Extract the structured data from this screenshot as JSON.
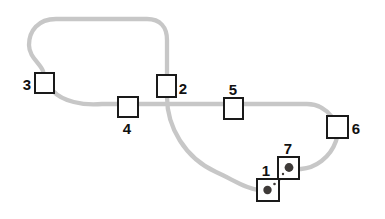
{
  "figure": {
    "width": 385,
    "height": 219,
    "background": "#ffffff",
    "track": {
      "name": "route-track",
      "d": "M 56 19 L 147 19 C 160 19 167 27 167 40 L 167 97 C 167 127 185 158 216 172 C 234 180 246 189 259 190 L 269 190 L 288 169 L 301 169 C 315 168 330 158 336 141 C 339 132 338 124 332 117 C 327 110 318 104 307 104 L 102 104 C 83 106 62 101 53 91 C 47 84 44 78 43 71 C 40 63 29 57 29 45 C 29 31 38 19 56 19 Z",
      "color": "#c7c7c7",
      "stroke_width": 4.3
    },
    "box_style": {
      "fill": "#ffffff",
      "border_color": "#1a1a1a",
      "border_width": 2
    },
    "label_color": "#111111",
    "dot_color": "#3e3a38",
    "boxes": [
      {
        "id": "3",
        "label": "3",
        "x": 35,
        "y": 73,
        "w": 19,
        "h": 20,
        "label_x": 27,
        "label_y": 90,
        "dot": null,
        "speck": null
      },
      {
        "id": "2",
        "label": "2",
        "x": 157,
        "y": 75,
        "w": 19,
        "h": 22,
        "label_x": 183,
        "label_y": 94,
        "dot": null,
        "speck": null
      },
      {
        "id": "4",
        "label": "4",
        "x": 118,
        "y": 97,
        "w": 20,
        "h": 20,
        "label_x": 127,
        "label_y": 134,
        "dot": null,
        "speck": null
      },
      {
        "id": "5",
        "label": "5",
        "x": 224,
        "y": 98,
        "w": 19,
        "h": 21,
        "label_x": 233,
        "label_y": 95,
        "dot": null,
        "speck": null
      },
      {
        "id": "6",
        "label": "6",
        "x": 327,
        "y": 116,
        "w": 21,
        "h": 22,
        "label_x": 356,
        "label_y": 134,
        "dot": null,
        "speck": null
      },
      {
        "id": "1",
        "label": "1",
        "x": 257,
        "y": 179,
        "w": 22,
        "h": 22,
        "label_x": 266,
        "label_y": 176,
        "dot": {
          "cx": 267.5,
          "cy": 190,
          "r": 4.2
        },
        "speck": {
          "cx": 274.5,
          "cy": 184,
          "r": 1.3
        }
      },
      {
        "id": "7",
        "label": "7",
        "x": 278,
        "y": 157,
        "w": 21,
        "h": 22,
        "label_x": 288,
        "label_y": 154,
        "dot": {
          "cx": 289,
          "cy": 167.5,
          "r": 4.4
        },
        "speck": {
          "cx": 283,
          "cy": 174,
          "r": 1.2
        }
      }
    ]
  }
}
